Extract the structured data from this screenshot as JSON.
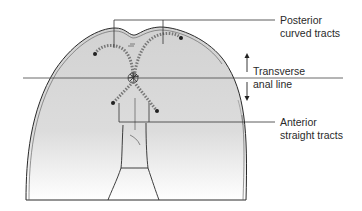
{
  "diagram": {
    "type": "anatomical-illustration",
    "colors": {
      "skin_fill_top": "#d4d4d4",
      "skin_fill_bottom": "#ffffff",
      "outline": "#2a2a2a",
      "tract": "#8a8a8a",
      "leader": "#333333"
    },
    "labels": {
      "posterior": {
        "line1": "Posterior",
        "line2": "curved tracts"
      },
      "transverse": {
        "line1": "Transverse",
        "line2": "anal line"
      },
      "anterior": {
        "line1": "Anterior",
        "line2": "straight tracts"
      }
    }
  }
}
